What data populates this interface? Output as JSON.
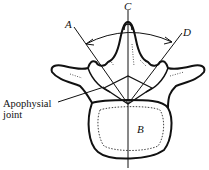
{
  "diagram": {
    "labels": {
      "A": "A",
      "B": "B",
      "C": "C",
      "D": "D"
    },
    "annotations": {
      "apophysial_joint_line1": "Apophysial",
      "apophysial_joint_line2": "joint"
    },
    "colors": {
      "ink": "#111111",
      "background": "#ffffff"
    }
  }
}
